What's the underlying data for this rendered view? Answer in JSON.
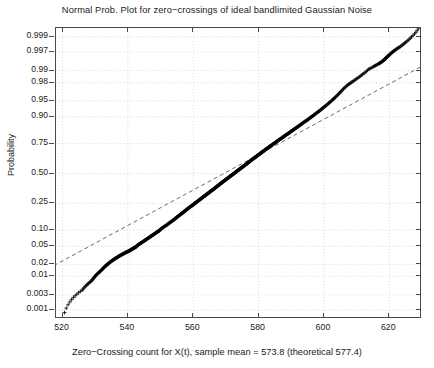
{
  "chart_data": {
    "type": "scatter",
    "title": "Normal Prob. Plot for zero−crossings of ideal bandlimited Gaussian Noise",
    "xlabel": "Zero−Crossing count for X(t), sample mean = 573.8 (theoretical 577.4)",
    "ylabel": "Probability",
    "xlim": [
      518,
      630
    ],
    "ylim_probability": [
      0.0005,
      0.9995
    ],
    "grid": true,
    "legend": null,
    "marker": "+",
    "marker_color": "#000000",
    "reference_line": {
      "style": "dashed",
      "color": "#555555",
      "description": "robust normal fit line through 1st and 3rd quartiles"
    },
    "xticks": [
      520,
      540,
      560,
      580,
      600,
      620
    ],
    "xtick_labels": [
      "520",
      "540",
      "560",
      "580",
      "600",
      "620"
    ],
    "yticks_probability": [
      0.999,
      0.997,
      0.99,
      0.98,
      0.95,
      0.9,
      0.75,
      0.5,
      0.25,
      0.1,
      0.05,
      0.02,
      0.01,
      0.003,
      0.001
    ],
    "ytick_labels": [
      "0.999",
      "0.997",
      "0.99",
      "0.98",
      "0.95",
      "0.90",
      "0.75",
      "0.50",
      "0.25",
      "0.10",
      "0.05",
      "0.02",
      "0.01",
      "0.003",
      "0.001"
    ],
    "sample_mean": 573.8,
    "theoretical_mean": 577.4,
    "n_points": 600,
    "points": [
      [
        520.6,
        0.00083
      ],
      [
        523.3,
        0.0025
      ],
      [
        526.0,
        0.00417
      ],
      [
        527.4,
        0.00583
      ],
      [
        528.8,
        0.0075
      ],
      [
        529.6,
        0.00917
      ],
      [
        530.3,
        0.01083
      ],
      [
        531.1,
        0.0125
      ],
      [
        531.8,
        0.01417
      ],
      [
        532.4,
        0.01583
      ],
      [
        532.9,
        0.0175
      ],
      [
        533.5,
        0.01917
      ],
      [
        534.0,
        0.02083
      ],
      [
        534.6,
        0.0225
      ],
      [
        535.1,
        0.02417
      ],
      [
        535.7,
        0.02583
      ],
      [
        536.2,
        0.0275
      ],
      [
        536.8,
        0.02917
      ],
      [
        537.3,
        0.03083
      ],
      [
        537.9,
        0.0325
      ],
      [
        538.4,
        0.03417
      ],
      [
        539.0,
        0.03583
      ],
      [
        539.5,
        0.0375
      ],
      [
        540.1,
        0.03917
      ],
      [
        540.6,
        0.04083
      ],
      [
        541.0,
        0.0425
      ],
      [
        541.4,
        0.04417
      ],
      [
        541.8,
        0.04583
      ],
      [
        542.2,
        0.0475
      ],
      [
        542.6,
        0.04917
      ],
      [
        543.0,
        0.0525
      ],
      [
        543.6,
        0.05583
      ],
      [
        544.2,
        0.05917
      ],
      [
        544.8,
        0.0625
      ],
      [
        545.3,
        0.06583
      ],
      [
        545.8,
        0.06917
      ],
      [
        546.3,
        0.0725
      ],
      [
        546.8,
        0.07583
      ],
      [
        547.2,
        0.07917
      ],
      [
        547.7,
        0.0825
      ],
      [
        548.1,
        0.08583
      ],
      [
        548.5,
        0.08917
      ],
      [
        548.9,
        0.0925
      ],
      [
        549.3,
        0.09583
      ],
      [
        549.7,
        0.09917
      ],
      [
        550.2,
        0.10583
      ],
      [
        550.9,
        0.1125
      ],
      [
        551.6,
        0.11917
      ],
      [
        552.2,
        0.12583
      ],
      [
        552.8,
        0.1325
      ],
      [
        553.3,
        0.13917
      ],
      [
        553.9,
        0.14583
      ],
      [
        554.4,
        0.1525
      ],
      [
        554.9,
        0.15917
      ],
      [
        555.3,
        0.16583
      ],
      [
        555.8,
        0.1725
      ],
      [
        556.2,
        0.17917
      ],
      [
        556.7,
        0.18583
      ],
      [
        557.1,
        0.1925
      ],
      [
        557.5,
        0.19917
      ],
      [
        557.9,
        0.20583
      ],
      [
        558.3,
        0.2125
      ],
      [
        558.7,
        0.21917
      ],
      [
        559.1,
        0.22583
      ],
      [
        559.5,
        0.2325
      ],
      [
        559.9,
        0.23917
      ],
      [
        560.3,
        0.24583
      ],
      [
        560.6,
        0.2525
      ],
      [
        561.0,
        0.25917
      ],
      [
        561.4,
        0.26583
      ],
      [
        561.7,
        0.2725
      ],
      [
        562.1,
        0.27917
      ],
      [
        562.4,
        0.28583
      ],
      [
        562.8,
        0.2925
      ],
      [
        563.1,
        0.29917
      ],
      [
        563.5,
        0.30583
      ],
      [
        563.8,
        0.3125
      ],
      [
        564.1,
        0.31917
      ],
      [
        564.5,
        0.32583
      ],
      [
        564.8,
        0.3325
      ],
      [
        565.1,
        0.33917
      ],
      [
        565.4,
        0.34583
      ],
      [
        565.8,
        0.3525
      ],
      [
        566.1,
        0.35917
      ],
      [
        566.4,
        0.36583
      ],
      [
        566.7,
        0.3725
      ],
      [
        567.0,
        0.37917
      ],
      [
        567.3,
        0.38583
      ],
      [
        567.6,
        0.3925
      ],
      [
        567.9,
        0.39917
      ],
      [
        568.2,
        0.40583
      ],
      [
        568.5,
        0.4125
      ],
      [
        568.8,
        0.41917
      ],
      [
        569.1,
        0.42583
      ],
      [
        569.4,
        0.4325
      ],
      [
        569.7,
        0.43917
      ],
      [
        570.0,
        0.44583
      ],
      [
        570.3,
        0.4525
      ],
      [
        570.6,
        0.45917
      ],
      [
        570.9,
        0.46583
      ],
      [
        571.2,
        0.4725
      ],
      [
        571.5,
        0.47917
      ],
      [
        571.8,
        0.48583
      ],
      [
        572.1,
        0.4925
      ],
      [
        572.4,
        0.49917
      ],
      [
        572.7,
        0.50583
      ],
      [
        573.0,
        0.5125
      ],
      [
        573.3,
        0.51917
      ],
      [
        573.6,
        0.52583
      ],
      [
        573.9,
        0.5325
      ],
      [
        574.2,
        0.53917
      ],
      [
        574.5,
        0.54583
      ],
      [
        574.8,
        0.5525
      ],
      [
        575.1,
        0.55917
      ],
      [
        575.4,
        0.56583
      ],
      [
        575.7,
        0.5725
      ],
      [
        576.0,
        0.57917
      ],
      [
        576.3,
        0.58583
      ],
      [
        576.6,
        0.5925
      ],
      [
        576.9,
        0.59917
      ],
      [
        577.2,
        0.60583
      ],
      [
        577.5,
        0.6125
      ],
      [
        577.8,
        0.61917
      ],
      [
        578.1,
        0.62583
      ],
      [
        578.4,
        0.6325
      ],
      [
        578.8,
        0.63917
      ],
      [
        579.1,
        0.64583
      ],
      [
        579.4,
        0.6525
      ],
      [
        579.7,
        0.65917
      ],
      [
        580.1,
        0.66583
      ],
      [
        580.4,
        0.6725
      ],
      [
        580.7,
        0.67917
      ],
      [
        581.1,
        0.68583
      ],
      [
        581.4,
        0.6925
      ],
      [
        581.8,
        0.69917
      ],
      [
        582.1,
        0.70583
      ],
      [
        582.5,
        0.7125
      ],
      [
        582.9,
        0.71917
      ],
      [
        583.2,
        0.72583
      ],
      [
        583.6,
        0.7325
      ],
      [
        584.0,
        0.73917
      ],
      [
        584.4,
        0.74583
      ],
      [
        584.8,
        0.7525
      ],
      [
        585.2,
        0.75917
      ],
      [
        585.6,
        0.76583
      ],
      [
        586.0,
        0.7725
      ],
      [
        586.4,
        0.77917
      ],
      [
        586.9,
        0.78583
      ],
      [
        587.3,
        0.7925
      ],
      [
        587.8,
        0.79917
      ],
      [
        588.2,
        0.80583
      ],
      [
        588.7,
        0.8125
      ],
      [
        589.2,
        0.81917
      ],
      [
        589.7,
        0.82583
      ],
      [
        590.2,
        0.8325
      ],
      [
        590.7,
        0.83917
      ],
      [
        591.2,
        0.84583
      ],
      [
        591.8,
        0.8525
      ],
      [
        592.3,
        0.85917
      ],
      [
        592.9,
        0.86583
      ],
      [
        593.5,
        0.8725
      ],
      [
        594.1,
        0.87917
      ],
      [
        594.8,
        0.88583
      ],
      [
        595.4,
        0.8925
      ],
      [
        596.1,
        0.89917
      ],
      [
        596.8,
        0.90583
      ],
      [
        597.5,
        0.9125
      ],
      [
        598.3,
        0.91917
      ],
      [
        599.1,
        0.92583
      ],
      [
        599.9,
        0.9325
      ],
      [
        600.8,
        0.93917
      ],
      [
        601.7,
        0.94583
      ],
      [
        602.7,
        0.9525
      ],
      [
        603.7,
        0.95917
      ],
      [
        604.8,
        0.96583
      ],
      [
        606.0,
        0.9725
      ],
      [
        607.3,
        0.9775
      ],
      [
        608.6,
        0.98083
      ],
      [
        610.1,
        0.98417
      ],
      [
        611.8,
        0.9875
      ],
      [
        613.7,
        0.99083
      ],
      [
        615.5,
        0.9925
      ],
      [
        616.8,
        0.9935
      ],
      [
        617.6,
        0.99417
      ],
      [
        618.2,
        0.9947
      ],
      [
        618.7,
        0.9952
      ],
      [
        619.2,
        0.9957
      ],
      [
        619.8,
        0.9962
      ],
      [
        620.5,
        0.9967
      ],
      [
        621.3,
        0.99717
      ],
      [
        622.3,
        0.9976
      ],
      [
        623.5,
        0.998
      ],
      [
        625.0,
        0.9985
      ],
      [
        626.8,
        0.999
      ],
      [
        629.0,
        0.9995
      ]
    ]
  }
}
